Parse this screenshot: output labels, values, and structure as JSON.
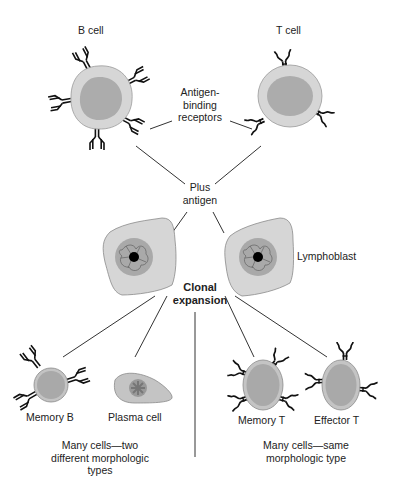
{
  "diagram": {
    "labels": {
      "b_cell": "B cell",
      "t_cell": "T cell",
      "receptors_line1": "Antigen-",
      "receptors_line2": "binding",
      "receptors_line3": "receptors",
      "plus_antigen_line1": "Plus",
      "plus_antigen_line2": "antigen",
      "lymphoblast": "Lymphoblast",
      "clonal_line1": "Clonal",
      "clonal_line2": "expansion",
      "memory_b": "Memory B",
      "plasma_cell": "Plasma cell",
      "memory_t": "Memory T",
      "effector_t": "Effector T",
      "left_caption_line1": "Many cells—two",
      "left_caption_line2": "different morphologic",
      "left_caption_line3": "types",
      "right_caption_line1": "Many cells—same",
      "right_caption_line2": "morphologic type"
    },
    "colors": {
      "cytoplasm": "#d6d6d6",
      "nucleus": "#a9a9a9",
      "outline": "#8a8a8a",
      "receptor": "#111111",
      "line": "#333333"
    }
  }
}
